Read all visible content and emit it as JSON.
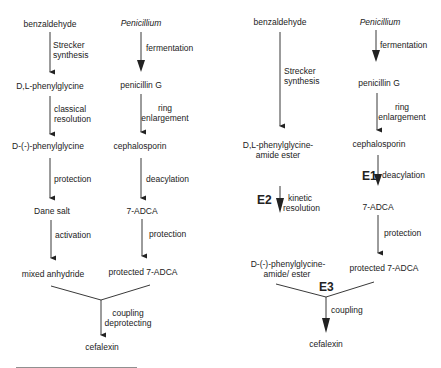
{
  "left_scheme": {
    "col1": {
      "nodes": [
        "benzaldehyde",
        "D,L-phenylglycine",
        "D-(-)-phenylglycine",
        "Dane salt",
        "mixed anhydride"
      ],
      "steps": [
        [
          "Strecker",
          "synthesis"
        ],
        [
          "classical",
          "resolution"
        ],
        [
          "protection"
        ],
        [
          "activation"
        ]
      ]
    },
    "col2": {
      "nodes": [
        "Penicillium",
        "penicillin G",
        "cephalosporin",
        "7-ADCA",
        "protected 7-ADCA"
      ],
      "steps": [
        [
          "fermentation"
        ],
        [
          "ring",
          "enlargement"
        ],
        [
          "deacylation"
        ],
        [
          "protection"
        ]
      ]
    },
    "merge_step": [
      "coupling",
      "deprotecting"
    ],
    "product": "cefalexin"
  },
  "right_scheme": {
    "col1": {
      "nodes": [
        "benzaldehyde",
        "D,L-phenylglycine-",
        "amide ester",
        "D-(-)-phenylglycine-",
        "amide/ ester"
      ],
      "steps": [
        [
          "Strecker",
          "synthesis"
        ],
        [
          "kinetic",
          "resolution"
        ]
      ],
      "enzyme": "E2"
    },
    "col2": {
      "nodes": [
        "Penicillium",
        "penicillin G",
        "cephalosporin",
        "7-ADCA",
        "protected 7-ADCA"
      ],
      "steps": [
        [
          "fermentation"
        ],
        [
          "ring",
          "enlargement"
        ],
        [
          "deacylation"
        ],
        [
          "protection"
        ]
      ],
      "enzyme": "E1"
    },
    "merge_enzyme": "E3",
    "merge_step": [
      "coupling"
    ],
    "product": "cefalexin"
  }
}
